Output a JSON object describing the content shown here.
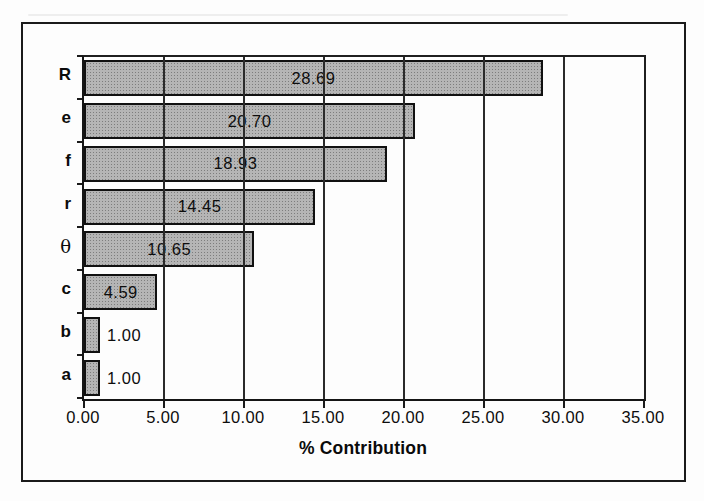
{
  "figure": {
    "background_color": "#fdfdfd",
    "frame_border_color": "#1b1b1b"
  },
  "chart_data": {
    "type": "bar",
    "orientation": "horizontal",
    "title": "",
    "xlabel": "% Contribution",
    "ylabel": "",
    "categories": [
      "R",
      "e",
      "f",
      "r",
      "θ",
      "c",
      "b",
      "a"
    ],
    "values": [
      28.69,
      20.7,
      18.93,
      14.45,
      10.65,
      4.59,
      1.0,
      1.0
    ],
    "value_labels": [
      "28.69",
      "20.70",
      "18.93",
      "14.45",
      "10.65",
      "4.59",
      "1.00",
      "1.00"
    ],
    "xlim": [
      0,
      35
    ],
    "x_tick_step": 5,
    "x_tick_labels": [
      "0.00",
      "5.00",
      "10.00",
      "15.00",
      "20.00",
      "25.00",
      "30.00",
      "35.00"
    ],
    "grid": "vertical-gridlines-on",
    "legend": "none",
    "bar_fill_color": "#b5b5b5",
    "bar_border_color": "#111111",
    "gridline_color": "#2a2a2a"
  }
}
